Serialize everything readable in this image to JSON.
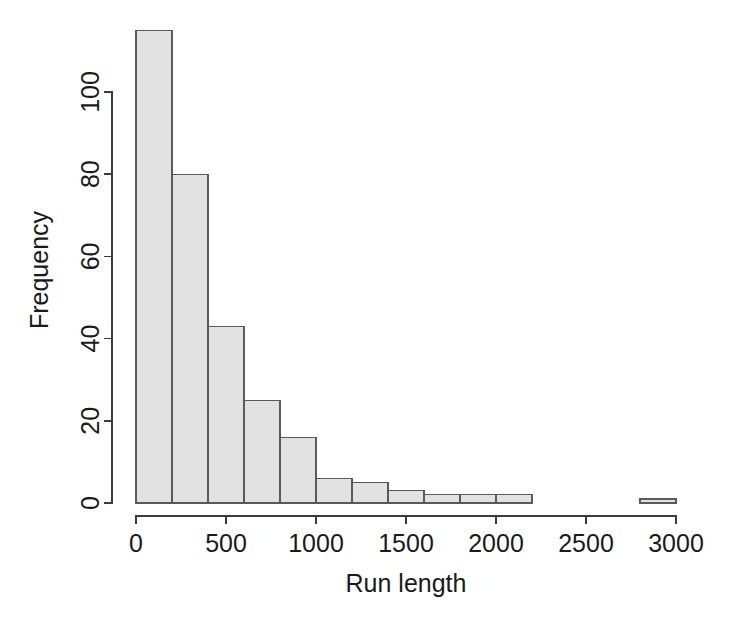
{
  "chart_data": {
    "type": "bar",
    "subtype": "histogram",
    "title": "",
    "xlabel": "Run length",
    "ylabel": "Frequency",
    "xlim": [
      0,
      3000
    ],
    "ylim": [
      0,
      115
    ],
    "grid": false,
    "legend": null,
    "bin_width": 200,
    "bar_fill_color": "#e2e2e2",
    "bar_border_color": "#5a5a5a",
    "axis_color": "#3b3b3b",
    "background_color": "#ffffff",
    "xticks": [
      0,
      500,
      1000,
      1500,
      2000,
      2500,
      3000
    ],
    "xtick_labels": [
      "0",
      "500",
      "1000",
      "1500",
      "2000",
      "2500",
      "3000"
    ],
    "yticks": [
      0,
      20,
      40,
      60,
      80,
      100
    ],
    "ytick_labels": [
      "0",
      "20",
      "40",
      "60",
      "80",
      "100"
    ],
    "bins": [
      {
        "x0": 0,
        "x1": 200,
        "value": 115
      },
      {
        "x0": 200,
        "x1": 400,
        "value": 80
      },
      {
        "x0": 400,
        "x1": 600,
        "value": 43
      },
      {
        "x0": 600,
        "x1": 800,
        "value": 25
      },
      {
        "x0": 800,
        "x1": 1000,
        "value": 16
      },
      {
        "x0": 1000,
        "x1": 1200,
        "value": 6
      },
      {
        "x0": 1200,
        "x1": 1400,
        "value": 5
      },
      {
        "x0": 1400,
        "x1": 1600,
        "value": 3
      },
      {
        "x0": 1600,
        "x1": 1800,
        "value": 2
      },
      {
        "x0": 1800,
        "x1": 2000,
        "value": 2
      },
      {
        "x0": 2000,
        "x1": 2200,
        "value": 2
      },
      {
        "x0": 2200,
        "x1": 2400,
        "value": 0
      },
      {
        "x0": 2400,
        "x1": 2600,
        "value": 0
      },
      {
        "x0": 2600,
        "x1": 2800,
        "value": 0
      },
      {
        "x0": 2800,
        "x1": 3000,
        "value": 1
      }
    ],
    "categories": [
      "0-200",
      "200-400",
      "400-600",
      "600-800",
      "800-1000",
      "1000-1200",
      "1200-1400",
      "1400-1600",
      "1600-1800",
      "1800-2000",
      "2000-2200",
      "2200-2400",
      "2400-2600",
      "2600-2800",
      "2800-3000"
    ],
    "values": [
      115,
      80,
      43,
      25,
      16,
      6,
      5,
      3,
      2,
      2,
      2,
      0,
      0,
      0,
      1
    ]
  }
}
